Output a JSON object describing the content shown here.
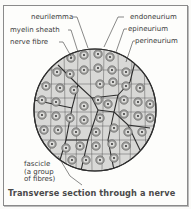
{
  "diagram": {
    "title": "Transverse section through a nerve",
    "labels": {
      "neurilemma": "neurilemma",
      "myelin_sheath": "myelin sheath",
      "nerve_fibre": "nerve fibre",
      "endoneurium": "endoneurium",
      "epineurium": "epineurium",
      "perineurium": "perineurium",
      "fascicle_line1": "fascicle",
      "fascicle_line2": "(a group",
      "fascicle_line3": "of fibres)"
    },
    "colors": {
      "circle_fill": "#c9c9c7",
      "cell_fill": "#e2e2e0",
      "outline": "#2e2e2e",
      "ring_fill": "#8a8a8a",
      "text": "#3a3a3a"
    }
  }
}
